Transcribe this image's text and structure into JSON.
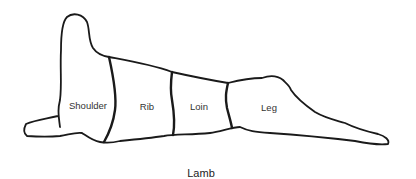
{
  "diagram": {
    "title": "Lamb",
    "cuts": [
      {
        "name": "Shoulder",
        "x": 88,
        "y": 105
      },
      {
        "name": "Rib",
        "x": 147,
        "y": 106
      },
      {
        "name": "Loin",
        "x": 199,
        "y": 106
      },
      {
        "name": "Leg",
        "x": 269,
        "y": 107
      }
    ],
    "caption": {
      "text": "Lamb",
      "x": 201,
      "y": 173
    },
    "colors": {
      "outline": "#1a1a1a",
      "background": "#ffffff",
      "text": "#333333"
    }
  }
}
